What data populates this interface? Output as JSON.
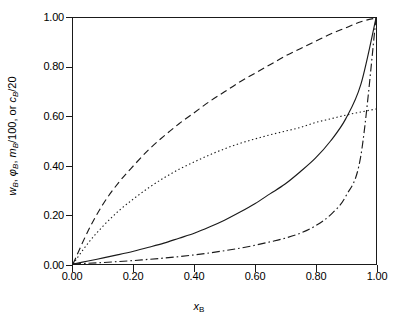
{
  "chart_data": {
    "type": "line",
    "title": "",
    "xlabel": "x_B",
    "ylabel": "w_B, φ_B, m_B/100, or c_B/20",
    "xlim": [
      0.0,
      1.0
    ],
    "ylim": [
      0.0,
      1.0
    ],
    "grid": false,
    "legend": "none",
    "x_ticks": [
      "0.00",
      "0.20",
      "0.40",
      "0.60",
      "0.80",
      "1.00"
    ],
    "x_tick_values": [
      0.0,
      0.2,
      0.4,
      0.6,
      0.8,
      1.0
    ],
    "y_ticks": [
      "0.00",
      "0.20",
      "0.40",
      "0.60",
      "0.80",
      "1.00"
    ],
    "y_tick_values": [
      0.0,
      0.2,
      0.4,
      0.6,
      0.8,
      1.0
    ],
    "x": [
      0.0,
      0.05,
      0.1,
      0.15,
      0.2,
      0.25,
      0.3,
      0.35,
      0.4,
      0.45,
      0.5,
      0.55,
      0.6,
      0.65,
      0.7,
      0.75,
      0.8,
      0.85,
      0.9,
      0.95,
      1.0
    ],
    "series": [
      {
        "name": "phi_B",
        "style": "dashed",
        "color": "#1a1a1a",
        "values": [
          0.0,
          0.135,
          0.245,
          0.33,
          0.4,
          0.465,
          0.52,
          0.57,
          0.615,
          0.66,
          0.7,
          0.74,
          0.775,
          0.81,
          0.845,
          0.875,
          0.905,
          0.935,
          0.96,
          0.985,
          1.0
        ]
      },
      {
        "name": "c_B/20",
        "style": "dotted",
        "color": "#1a1a1a",
        "values": [
          0.0,
          0.085,
          0.155,
          0.215,
          0.265,
          0.31,
          0.35,
          0.385,
          0.415,
          0.443,
          0.468,
          0.49,
          0.508,
          0.525,
          0.54,
          0.555,
          0.575,
          0.59,
          0.605,
          0.618,
          0.63
        ]
      },
      {
        "name": "w_B",
        "style": "solid",
        "color": "#1a1a1a",
        "values": [
          0.0,
          0.012,
          0.025,
          0.038,
          0.052,
          0.068,
          0.085,
          0.105,
          0.125,
          0.15,
          0.178,
          0.21,
          0.245,
          0.285,
          0.325,
          0.375,
          0.43,
          0.5,
          0.59,
          0.73,
          1.0
        ]
      },
      {
        "name": "m_B/100",
        "style": "dash-dot",
        "color": "#1a1a1a",
        "values": [
          0.0,
          0.003,
          0.006,
          0.01,
          0.014,
          0.019,
          0.024,
          0.03,
          0.037,
          0.045,
          0.054,
          0.064,
          0.076,
          0.09,
          0.105,
          0.125,
          0.155,
          0.2,
          0.275,
          0.44,
          1.0
        ]
      }
    ]
  },
  "axes": {
    "y_title_parts": {
      "p1": "w",
      "s1": "B",
      "sep1": ", ",
      "p2": "φ",
      "s2": "B",
      "sep2": ", ",
      "p3": "m",
      "s3": "B",
      "p3b": "/100, or ",
      "p4": "c",
      "s4": "B",
      "p4b": "/20"
    },
    "x_title_parts": {
      "p1": "x",
      "s1": "B"
    }
  }
}
